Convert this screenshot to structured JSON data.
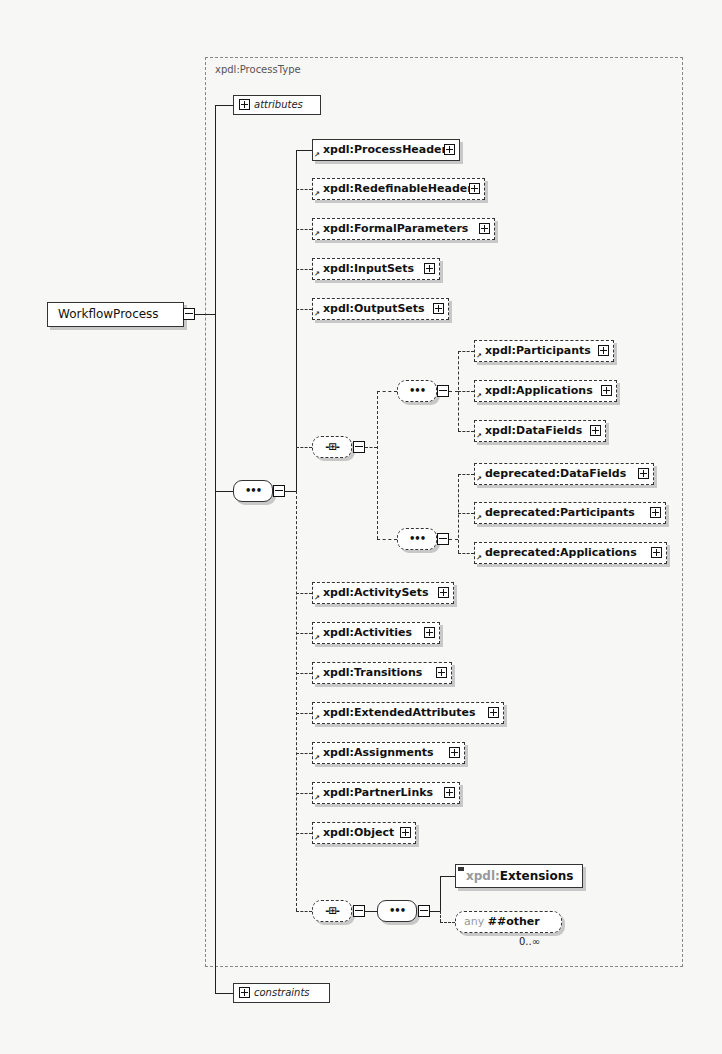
{
  "diagram": {
    "root": {
      "label": "WorkflowProcess"
    },
    "type_label": "xpdl:ProcessType",
    "attributes_label": "attributes",
    "constraints_label": "constraints",
    "sequence_top": [
      {
        "label": "xpdl:ProcessHeader",
        "optional": false
      },
      {
        "label": "xpdl:RedefinableHeader",
        "optional": true
      },
      {
        "label": "xpdl:FormalParameters",
        "optional": true
      },
      {
        "label": "xpdl:InputSets",
        "optional": true
      },
      {
        "label": "xpdl:OutputSets",
        "optional": true
      }
    ],
    "choice_group_1": [
      {
        "label": "xpdl:Participants",
        "optional": true
      },
      {
        "label": "xpdl:Applications",
        "optional": true
      },
      {
        "label": "xpdl:DataFields",
        "optional": true
      }
    ],
    "choice_group_2": [
      {
        "label": "deprecated:DataFields",
        "optional": true
      },
      {
        "label": "deprecated:Participants",
        "optional": true
      },
      {
        "label": "deprecated:Applications",
        "optional": true
      }
    ],
    "sequence_bottom": [
      {
        "label": "xpdl:ActivitySets",
        "optional": true
      },
      {
        "label": "xpdl:Activities",
        "optional": true
      },
      {
        "label": "xpdl:Transitions",
        "optional": true
      },
      {
        "label": "xpdl:ExtendedAttributes",
        "optional": true
      },
      {
        "label": "xpdl:Assignments",
        "optional": true
      },
      {
        "label": "xpdl:PartnerLinks",
        "optional": true
      },
      {
        "label": "xpdl:Object",
        "optional": true
      }
    ],
    "extensions": {
      "ns": "xpdl:",
      "name": "Extensions",
      "any_keyword": "any",
      "any_value": "##other",
      "cardinality": "0..∞"
    },
    "compositor_glyphs": {
      "sequence": "•••",
      "choice": "-⊞-"
    }
  }
}
